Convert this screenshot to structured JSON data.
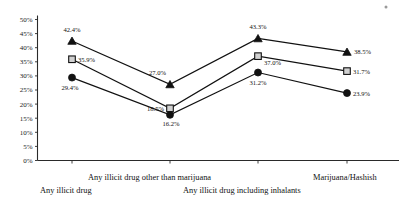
{
  "chart_data": {
    "type": "line",
    "title": "",
    "subtitle": "",
    "xlabel": "",
    "ylabel": "",
    "ylim": [
      0,
      50
    ],
    "grid": false,
    "legend_position": "none",
    "categories": [
      "Any illicit drug",
      "Any illicit drug other than marijuana",
      "Any illicit drug including inhalants",
      "Marijuana/Hashish"
    ],
    "ytick_labels": [
      "50%",
      "45%",
      "40%",
      "35%",
      "30%",
      "25%",
      "20%",
      "15%",
      "10%",
      "5%",
      "0%"
    ],
    "ytick_values": [
      50,
      45,
      40,
      35,
      30,
      25,
      20,
      15,
      10,
      5,
      0
    ],
    "series": [
      {
        "name": "series-triangle",
        "marker": "triangle",
        "values": [
          42.4,
          27.0,
          43.3,
          38.5
        ],
        "labels": [
          "42.4%",
          "27.0%",
          "43.3%",
          "38.5%"
        ]
      },
      {
        "name": "series-square",
        "marker": "square",
        "values": [
          35.9,
          18.5,
          37.0,
          31.7
        ],
        "labels": [
          "35.9%",
          "18.5%",
          "37.0%",
          "31.7%"
        ]
      },
      {
        "name": "series-circle",
        "marker": "circle",
        "values": [
          29.4,
          16.2,
          31.2,
          23.9
        ],
        "labels": [
          "29.4%",
          "16.2%",
          "31.2%",
          "23.9%"
        ]
      }
    ]
  },
  "annotations": {
    "speck": "scan-artifact-dot"
  }
}
